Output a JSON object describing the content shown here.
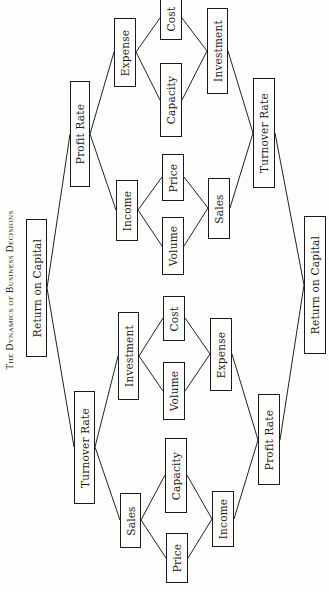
{
  "title": "The Dynamics of Business Decisions",
  "nodes": {
    "roc_left": "Return on Capital",
    "profit_rate_top": "Profit Rate",
    "turnover_rate_bottom": "Turnover Rate",
    "expense_top": "Expense",
    "cost_top": "Cost",
    "capacity_top": "Capacity",
    "investment_top": "Investment",
    "turnover_rate_top": "Turnover Rate",
    "income_top": "Income",
    "price_top": "Price",
    "volume_top": "Volume",
    "sales_top": "Sales",
    "roc_right": "Return on Capital",
    "investment_bottom": "Investment",
    "cost_bottom": "Cost",
    "volume_bottom": "Volume",
    "expense_bottom": "Expense",
    "profit_rate_bottom": "Profit Rate",
    "sales_bottom": "Sales",
    "capacity_bottom": "Capacity",
    "price_bottom": "Price",
    "income_bottom": "Income"
  },
  "edges": [
    [
      "Return on Capital (left)",
      "Profit Rate (upper)"
    ],
    [
      "Return on Capital (left)",
      "Turnover Rate (lower)"
    ],
    [
      "Profit Rate (upper)",
      "Expense (upper)"
    ],
    [
      "Profit Rate (upper)",
      "Income (upper)"
    ],
    [
      "Expense (upper)",
      "Cost (upper)"
    ],
    [
      "Expense (upper)",
      "Capacity (upper)"
    ],
    [
      "Cost (upper)",
      "Investment (upper)"
    ],
    [
      "Capacity (upper)",
      "Investment (upper)"
    ],
    [
      "Investment (upper)",
      "Turnover Rate (upper)"
    ],
    [
      "Income (upper)",
      "Price (upper)"
    ],
    [
      "Income (upper)",
      "Volume (upper)"
    ],
    [
      "Price (upper)",
      "Sales (upper)"
    ],
    [
      "Volume (upper)",
      "Sales (upper)"
    ],
    [
      "Sales (upper)",
      "Turnover Rate (upper)"
    ],
    [
      "Turnover Rate (upper)",
      "Return on Capital (right)"
    ],
    [
      "Turnover Rate (lower)",
      "Investment (lower)"
    ],
    [
      "Turnover Rate (lower)",
      "Sales (lower)"
    ],
    [
      "Investment (lower)",
      "Cost (lower)"
    ],
    [
      "Investment (lower)",
      "Volume (lower)"
    ],
    [
      "Cost (lower)",
      "Expense (lower)"
    ],
    [
      "Volume (lower)",
      "Expense (lower)"
    ],
    [
      "Expense (lower)",
      "Profit Rate (lower)"
    ],
    [
      "Sales (lower)",
      "Capacity (lower)"
    ],
    [
      "Sales (lower)",
      "Price (lower)"
    ],
    [
      "Capacity (lower)",
      "Income (lower)"
    ],
    [
      "Price (lower)",
      "Income (lower)"
    ],
    [
      "Income (lower)",
      "Profit Rate (lower)"
    ],
    [
      "Profit Rate (lower)",
      "Return on Capital (right)"
    ]
  ]
}
